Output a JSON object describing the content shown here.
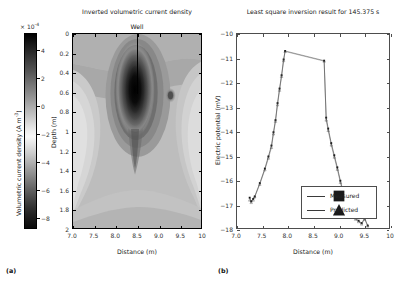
{
  "figure": {
    "panel_a_label": "(a)",
    "panel_b_label": "(b)"
  },
  "colorbar": {
    "multiplier": "× 10",
    "multiplier_exp": "-4",
    "title": "Volumetric current density  (A m",
    "title_exp": "-3",
    "title_tail": ")",
    "ticks": [
      4,
      2,
      0,
      -2,
      -4,
      -6,
      -8
    ],
    "tick_labels": [
      "4",
      "2",
      "0",
      "−2",
      "−4",
      "−6",
      "−8"
    ],
    "range": [
      -8.8,
      5.2
    ]
  },
  "chart_data": [
    {
      "type": "heatmap",
      "title": "Inverted volumetric current density",
      "xlabel": "Distance (m)",
      "ylabel": "Depth (m)",
      "xlim": [
        7.0,
        10.0
      ],
      "ylim": [
        2.0,
        0.0
      ],
      "xticks": [
        7.0,
        7.5,
        8.0,
        8.5,
        9.0,
        9.5,
        10.0
      ],
      "xtick_labels": [
        "7.0",
        "7.5",
        "8.0",
        "8.5",
        "9.0",
        "9.5",
        "10"
      ],
      "yticks": [
        0,
        0.2,
        0.4,
        0.6,
        0.8,
        1.0,
        1.2,
        1.4,
        1.6,
        1.8,
        2.0
      ],
      "ytick_labels": [
        "0",
        "0.2",
        "0.4",
        "0.6",
        "0.8",
        "1",
        "1.2",
        "1.4",
        "1.6",
        "1.8",
        "2"
      ],
      "colorbar_units": "A m^-3, ×10^-4",
      "zlim": [
        -8.8,
        5.2
      ],
      "grid": false,
      "annotation": {
        "label": "Well",
        "x": 8.5,
        "depth_top": 0.0,
        "depth_bottom": 0.62
      },
      "anomaly": {
        "center_x": 8.45,
        "center_depth": 0.62,
        "peak_value": 5.0,
        "description": "dark high-amplitude plume beneath well"
      }
    },
    {
      "type": "line",
      "title": "Least square inversion result for 145.375 s",
      "xlabel": "Distance (m)",
      "ylabel": "Electric potential (mV)",
      "xlim": [
        7.0,
        10.0
      ],
      "ylim": [
        -18.0,
        -10.0
      ],
      "xticks": [
        7.0,
        7.5,
        8.0,
        8.5,
        9.0,
        9.5,
        10.0
      ],
      "xtick_labels": [
        "7.0",
        "7.5",
        "8.0",
        "8.5",
        "9.0",
        "9.5",
        "10"
      ],
      "yticks": [
        -18,
        -17,
        -16,
        -15,
        -14,
        -13,
        -12,
        -11,
        -10
      ],
      "ytick_labels": [
        "−18",
        "−17",
        "−16",
        "−15",
        "−14",
        "−13",
        "−12",
        "−11",
        "−10"
      ],
      "grid": false,
      "legend_position": "lower center-left",
      "series": [
        {
          "name": "Measured",
          "x": [
            7.25,
            7.28,
            7.32,
            7.35,
            7.45,
            7.55,
            7.62,
            7.68,
            7.72,
            7.76,
            7.8,
            7.84,
            7.88,
            7.92,
            7.95,
            8.72,
            8.76,
            8.8,
            8.86,
            8.92,
            8.98,
            9.04,
            9.1,
            9.16,
            9.22,
            9.28,
            9.34,
            9.4,
            9.46,
            9.52,
            9.58
          ],
          "y": [
            -16.75,
            -16.9,
            -16.8,
            -16.7,
            -16.15,
            -15.55,
            -15.05,
            -14.6,
            -14.05,
            -13.55,
            -12.85,
            -12.25,
            -11.7,
            -11.05,
            -10.7,
            -11.1,
            -13.45,
            -13.9,
            -14.5,
            -15.0,
            -15.5,
            -16.05,
            -16.55,
            -16.95,
            -17.25,
            -17.45,
            -17.6,
            -17.7,
            -17.8,
            -17.6,
            -17.9
          ]
        },
        {
          "name": "Predicted",
          "x": [
            7.25,
            7.28,
            7.32,
            7.35,
            7.45,
            7.55,
            7.62,
            7.68,
            7.72,
            7.76,
            7.8,
            7.84,
            7.88,
            7.92,
            7.95,
            8.72,
            8.76,
            8.8,
            8.86,
            8.92,
            8.98,
            9.04,
            9.1,
            9.16,
            9.22,
            9.28,
            9.34,
            9.4,
            9.46,
            9.52,
            9.58
          ],
          "y": [
            -16.85,
            -16.95,
            -16.85,
            -16.72,
            -16.2,
            -15.6,
            -15.12,
            -14.68,
            -14.12,
            -13.6,
            -12.92,
            -12.32,
            -11.75,
            -11.1,
            -10.72,
            -11.12,
            -13.55,
            -13.98,
            -14.58,
            -15.08,
            -15.58,
            -16.12,
            -16.62,
            -17.0,
            -17.3,
            -17.5,
            -17.64,
            -17.74,
            -17.84,
            -17.64,
            -17.92
          ]
        }
      ],
      "legend": [
        {
          "label": "Measured",
          "marker": "square"
        },
        {
          "label": "Predicted",
          "marker": "triangle"
        }
      ]
    }
  ]
}
